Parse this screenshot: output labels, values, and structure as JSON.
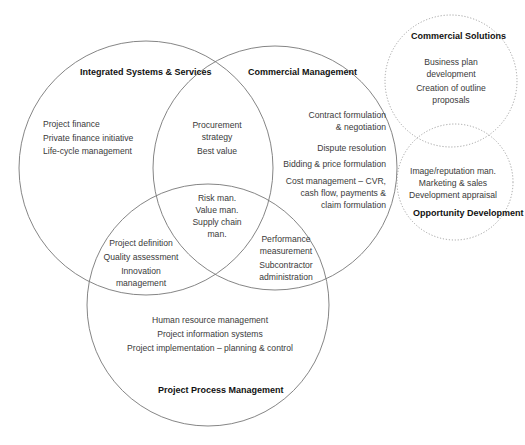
{
  "diagram": {
    "type": "venn",
    "circles": [
      {
        "id": "integrated",
        "title_lines": [
          "Integrated Systems &",
          "Services"
        ],
        "style": "solid",
        "items": [
          "Project finance",
          "Private finance initiative",
          "Life-cycle management"
        ]
      },
      {
        "id": "commercial",
        "title_lines": [
          "Commercial",
          "Management"
        ],
        "style": "solid",
        "items": [
          [
            "Contract formulation",
            "& negotiation"
          ],
          [
            "Dispute resolution"
          ],
          [
            "Bidding & price formulation"
          ],
          [
            "Cost management – CVR,",
            "cash flow,  payments &",
            "claim formulation"
          ]
        ]
      },
      {
        "id": "project-process",
        "title_lines": [
          "Project Process",
          "Management"
        ],
        "style": "solid",
        "items": [
          "Human resource management",
          "Project information systems",
          "Project implementation – planning & control"
        ]
      },
      {
        "id": "commercial-solutions",
        "title_lines": [
          "Commercial",
          "Solutions"
        ],
        "style": "dotted",
        "items": [
          [
            "Business plan",
            "development"
          ],
          [
            "Creation of outline",
            "proposals"
          ]
        ]
      },
      {
        "id": "opportunity-development",
        "title_lines": [
          "Opportunity",
          "Development"
        ],
        "style": "dotted",
        "items": [
          "Image/reputation man.",
          "Marketing & sales",
          "Development appraisal"
        ]
      }
    ],
    "intersections": {
      "integrated_commercial": {
        "items": [
          [
            "Procurement",
            "strategy"
          ],
          [
            "Best value"
          ]
        ]
      },
      "integrated_project": {
        "items": [
          [
            "Project definition"
          ],
          [
            "Quality assessment"
          ],
          [
            "Innovation",
            "management"
          ]
        ]
      },
      "commercial_project": {
        "items": [
          [
            "Performance",
            "measurement"
          ],
          [
            "Subcontractor",
            "administration"
          ]
        ]
      },
      "all_three": {
        "items": [
          "Risk man.",
          "Value man.",
          "Supply chain",
          "man."
        ]
      }
    },
    "colors": {
      "circle_stroke": "#777777",
      "dotted_stroke": "#999999",
      "title_text": "#111111",
      "body_text": "#3a3a3a",
      "background": "#ffffff"
    }
  }
}
